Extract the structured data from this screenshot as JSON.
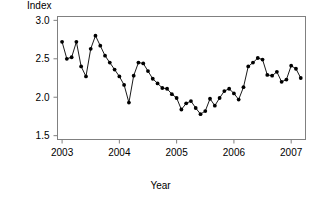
{
  "chart_data": {
    "type": "line",
    "title": "",
    "subtitle": "",
    "xlabel": "Year",
    "ylabel": "Index",
    "grid": false,
    "legend": false,
    "legend_position": "none",
    "marker": "filled-circle",
    "line_color": "#000000",
    "marker_color": "#000000",
    "background": "#ffffff",
    "axis_color": "#808080",
    "xlim": [
      2002.92,
      2007.25
    ],
    "ylim": [
      1.45,
      3.05
    ],
    "xticks": [
      2003,
      2004,
      2005,
      2006,
      2007
    ],
    "xticklabels": [
      "2003",
      "2004",
      "2005",
      "2006",
      "2007"
    ],
    "yticks": [
      1.5,
      2.0,
      2.5,
      3.0
    ],
    "yticklabels": [
      "1.5",
      "2.0",
      "2.5",
      "3.0"
    ],
    "x": [
      2003.0,
      2003.083,
      2003.167,
      2003.25,
      2003.333,
      2003.417,
      2003.5,
      2003.583,
      2003.667,
      2003.75,
      2003.833,
      2003.917,
      2004.0,
      2004.083,
      2004.167,
      2004.25,
      2004.333,
      2004.417,
      2004.5,
      2004.583,
      2004.667,
      2004.75,
      2004.833,
      2004.917,
      2005.0,
      2005.083,
      2005.167,
      2005.25,
      2005.333,
      2005.417,
      2005.5,
      2005.583,
      2005.667,
      2005.75,
      2005.833,
      2005.917,
      2006.0,
      2006.083,
      2006.167,
      2006.25,
      2006.333,
      2006.417,
      2006.5,
      2006.583,
      2006.667,
      2006.75,
      2006.833,
      2006.917,
      2007.0,
      2007.083,
      2007.167
    ],
    "values": [
      2.72,
      2.5,
      2.52,
      2.72,
      2.4,
      2.27,
      2.63,
      2.8,
      2.67,
      2.54,
      2.45,
      2.36,
      2.27,
      2.16,
      1.93,
      2.28,
      2.45,
      2.44,
      2.34,
      2.24,
      2.18,
      2.12,
      2.11,
      2.04,
      1.99,
      1.84,
      1.92,
      1.95,
      1.86,
      1.78,
      1.82,
      1.98,
      1.89,
      1.99,
      2.08,
      2.11,
      2.05,
      1.97,
      2.13,
      2.4,
      2.45,
      2.51,
      2.49,
      2.29,
      2.28,
      2.33,
      2.2,
      2.23,
      2.41,
      2.37,
      2.25
    ]
  },
  "labels": {
    "ylabel": "Index",
    "xlabel": "Year"
  }
}
